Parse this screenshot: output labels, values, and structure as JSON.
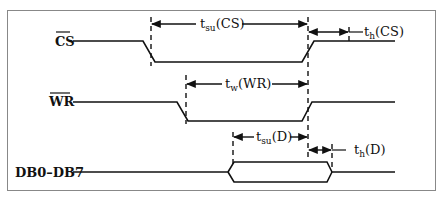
{
  "colors": {
    "line": "#111111",
    "frame": "#888888",
    "background": "#ffffff"
  },
  "signals": [
    {
      "name": "CS",
      "overbar": true,
      "label": "CS"
    },
    {
      "name": "WR",
      "overbar": true,
      "label": "WR"
    },
    {
      "name": "DB0-DB7",
      "overbar": false,
      "label": "DB0–DB7"
    }
  ],
  "timings": [
    {
      "id": "tsu_cs",
      "base": "t",
      "sub": "su",
      "arg": "(CS)",
      "label": "tsu(CS)"
    },
    {
      "id": "th_cs",
      "base": "t",
      "sub": "h",
      "arg": "(CS)",
      "label": "th(CS)"
    },
    {
      "id": "tw_wr",
      "base": "t",
      "sub": "w",
      "arg": "(WR)",
      "label": "tw(WR)"
    },
    {
      "id": "tsu_d",
      "base": "t",
      "sub": "su",
      "arg": "(D)",
      "label": "tsu(D)"
    },
    {
      "id": "th_d",
      "base": "t",
      "sub": "h",
      "arg": "(D)",
      "label": "th(D)"
    }
  ]
}
